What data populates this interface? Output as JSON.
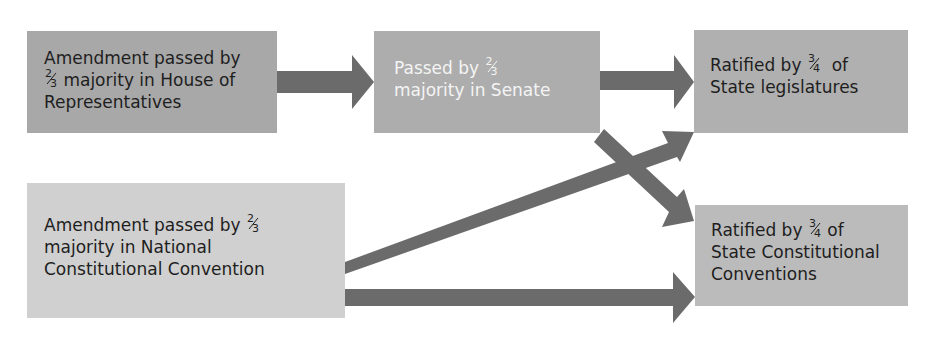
{
  "diagram": {
    "title": "",
    "colors": {
      "arrow": "#6b6b6b",
      "box_house": "#a8a8a8",
      "box_senate": "#adadad",
      "box_state_legislatures": "#b0b0b0",
      "box_national_convention": "#d0d0d0",
      "box_state_conventions": "#bbbbbb"
    },
    "nodes": [
      {
        "id": "house",
        "line1": "Amendment passed by",
        "frac_num": "2",
        "frac_den": "3",
        "line2_rest": " majority in House of",
        "line3": "Representatives"
      },
      {
        "id": "senate",
        "line1_pre": "Passed by ",
        "frac_num": "2",
        "frac_den": "3",
        "line2": "majority in Senate"
      },
      {
        "id": "state_legislatures",
        "line1_pre": "Ratified by ",
        "frac_num": "3",
        "frac_den": "4",
        "line1_post": "  of",
        "line2": "State legislatures"
      },
      {
        "id": "national_convention",
        "line1_pre": "Amendment passed by ",
        "frac_num": "2",
        "frac_den": "3",
        "line2": "majority in National",
        "line3": "Constitutional Convention"
      },
      {
        "id": "state_conventions",
        "line1_pre": "Ratified by ",
        "frac_num": "3",
        "frac_den": "4",
        "line1_post": " of",
        "line2": "State Constitutional",
        "line3": "Conventions"
      }
    ],
    "edges": [
      {
        "from": "house",
        "to": "senate"
      },
      {
        "from": "senate",
        "to": "state_legislatures"
      },
      {
        "from": "senate",
        "to": "state_conventions"
      },
      {
        "from": "national_convention",
        "to": "state_legislatures"
      },
      {
        "from": "national_convention",
        "to": "state_conventions"
      }
    ]
  }
}
